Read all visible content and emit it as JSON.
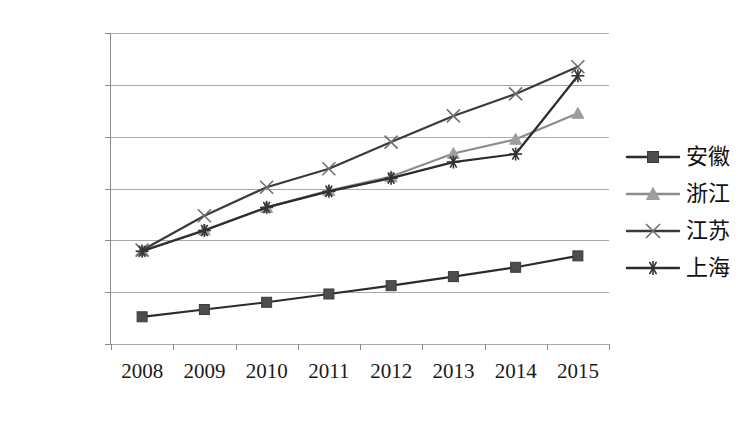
{
  "chart_data": {
    "type": "line",
    "title": "",
    "subtitle": "",
    "xlabel": "",
    "ylabel": "",
    "categories": [
      "2008",
      "2009",
      "2010",
      "2011",
      "2012",
      "2013",
      "2014",
      "2015"
    ],
    "x": [
      2008,
      2009,
      2010,
      2011,
      2012,
      2013,
      2014,
      2015
    ],
    "ylim": [
      0,
      120000
    ],
    "yticks": [
      0,
      20000,
      40000,
      60000,
      80000,
      100000,
      120000
    ],
    "ytick_labels": [
      "0",
      "20000",
      "40000",
      "60000",
      "80000",
      "100000",
      "120000"
    ],
    "grid": true,
    "legend_position": "right",
    "series": [
      {
        "name": "安徽",
        "marker": "square",
        "color": "#4d4d4d",
        "line_color": "#2b2b2b",
        "values": [
          10500,
          13300,
          16100,
          19300,
          22500,
          26000,
          29600,
          34000
        ]
      },
      {
        "name": "浙江",
        "marker": "triangle",
        "color": "#9e9e9e",
        "line_color": "#8c8c8c",
        "values": [
          36000,
          44000,
          52700,
          59200,
          64600,
          73500,
          79000,
          89000
        ]
      },
      {
        "name": "江苏",
        "marker": "x",
        "color": "#6e6e6e",
        "line_color": "#3a3a3a",
        "values": [
          36200,
          49500,
          60500,
          67600,
          77900,
          88000,
          96500,
          107000
        ]
      },
      {
        "name": "上海",
        "marker": "asterisk",
        "color": "#333333",
        "line_color": "#2b2b2b",
        "values": [
          35800,
          43800,
          52700,
          58900,
          64000,
          70200,
          73300,
          103500
        ]
      }
    ]
  },
  "legend": {
    "items": [
      {
        "label": "安徽",
        "marker": "square"
      },
      {
        "label": "浙江",
        "marker": "triangle"
      },
      {
        "label": "江苏",
        "marker": "x"
      },
      {
        "label": "上海",
        "marker": "asterisk"
      }
    ]
  },
  "colors": {
    "background": "#ffffff",
    "grid": "#a9a9a9",
    "axis": "#8a8a8a",
    "text": "#1a1a1a"
  }
}
